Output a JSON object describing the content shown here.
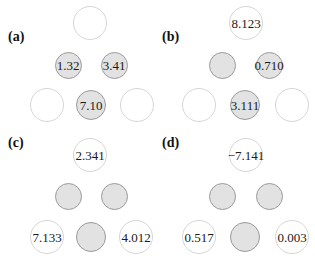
{
  "figure": {
    "panels": [
      {
        "label": "(a)",
        "label_pos": [
          8,
          41
        ],
        "nodes": [
          {
            "id": "root",
            "value": "",
            "style": "white",
            "x": 90,
            "y": 23
          },
          {
            "id": "mid-left",
            "value": "1.32",
            "style": "gray",
            "x": 68,
            "y": 65
          },
          {
            "id": "mid-right",
            "value": "3.41",
            "style": "gray",
            "x": 114,
            "y": 65
          },
          {
            "id": "bottom-left",
            "value": "",
            "style": "white",
            "x": 47,
            "y": 105
          },
          {
            "id": "bottom-middle",
            "value": "7.10",
            "style": "gray",
            "x": 91,
            "y": 105
          },
          {
            "id": "bottom-right",
            "value": "",
            "style": "white",
            "x": 137,
            "y": 105
          }
        ]
      },
      {
        "label": "(b)",
        "label_pos": [
          162,
          41
        ],
        "nodes": [
          {
            "id": "root",
            "value": "8.123",
            "style": "white",
            "x": 246,
            "y": 23
          },
          {
            "id": "mid-left",
            "value": "",
            "style": "gray",
            "x": 222,
            "y": 65
          },
          {
            "id": "mid-right",
            "value": "0.710",
            "style": "gray",
            "x": 269,
            "y": 65
          },
          {
            "id": "bottom-left",
            "value": "",
            "style": "white",
            "x": 199,
            "y": 105
          },
          {
            "id": "bottom-middle",
            "value": "3.111",
            "style": "gray",
            "x": 245,
            "y": 105
          },
          {
            "id": "bottom-right",
            "value": "",
            "style": "white",
            "x": 292,
            "y": 105
          }
        ]
      },
      {
        "label": "(c)",
        "label_pos": [
          8,
          147
        ],
        "nodes": [
          {
            "id": "root",
            "value": "2.341",
            "style": "white",
            "x": 90,
            "y": 155
          },
          {
            "id": "mid-left",
            "value": "",
            "style": "gray",
            "x": 68,
            "y": 196
          },
          {
            "id": "mid-right",
            "value": "",
            "style": "gray",
            "x": 114,
            "y": 196
          },
          {
            "id": "bottom-left",
            "value": "7.133",
            "style": "white",
            "x": 47,
            "y": 237
          },
          {
            "id": "bottom-middle",
            "value": "",
            "style": "gray",
            "x": 91,
            "y": 237
          },
          {
            "id": "bottom-right",
            "value": "4.012",
            "style": "white",
            "x": 136,
            "y": 237
          }
        ]
      },
      {
        "label": "(d)",
        "label_pos": [
          162,
          147
        ],
        "nodes": [
          {
            "id": "root",
            "value": "−7.141",
            "style": "white",
            "x": 246,
            "y": 155
          },
          {
            "id": "mid-left",
            "value": "",
            "style": "gray",
            "x": 222,
            "y": 196
          },
          {
            "id": "mid-right",
            "value": "",
            "style": "gray",
            "x": 269,
            "y": 196
          },
          {
            "id": "bottom-left",
            "value": "0.517",
            "style": "white",
            "x": 199,
            "y": 237
          },
          {
            "id": "bottom-middle",
            "value": "",
            "style": "gray",
            "x": 245,
            "y": 237
          },
          {
            "id": "bottom-right",
            "value": "0.003",
            "style": "white",
            "x": 292,
            "y": 237
          }
        ]
      }
    ]
  },
  "colors": {
    "white_fill": "#ffffff",
    "white_border": "#d6d6d6",
    "gray_fill": "#e2e2e2",
    "gray_border": "#9a9a9a",
    "text": "#1a1a1a"
  }
}
